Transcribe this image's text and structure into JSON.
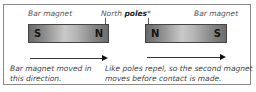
{
  "labels": {
    "left_magnet": "Bar magnet",
    "north_prefix": "North ",
    "north_bold": "poles",
    "north_suffix": "*",
    "right_magnet": "Bar magnet"
  },
  "magnets": [
    {
      "left_pole": "S",
      "right_pole": "N"
    },
    {
      "left_pole": "N",
      "right_pole": "S"
    }
  ],
  "captions": {
    "left_line1": "Bar magnet moved in",
    "left_line2": "this direction.",
    "right_line1": "Like poles repel, so the second magnet",
    "right_line2": "moves before contact is made."
  },
  "colors": {
    "border": "#8a8a8a",
    "magnet_dark": "#6a6a6a",
    "magnet_light": "#c9c9c9"
  }
}
